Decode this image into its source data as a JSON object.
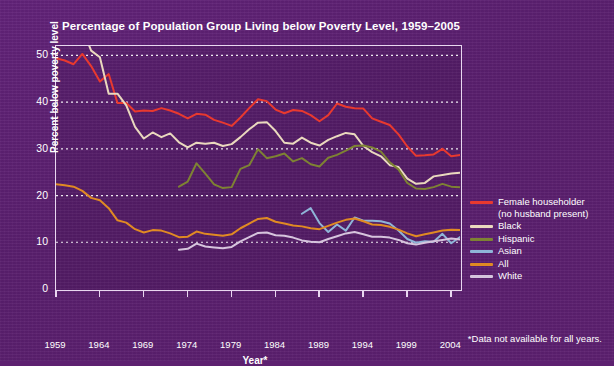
{
  "chart_data": {
    "type": "line",
    "title": "Percentage of Population Group Living below Poverty Level, 1959–2005",
    "xlabel": "Year*",
    "ylabel": "Percent below poverty level",
    "footnote": "*Data not available for all years.",
    "xlim": [
      1959,
      2005
    ],
    "ylim": [
      0,
      52
    ],
    "yticks": [
      0,
      10,
      20,
      30,
      40,
      50
    ],
    "xticks": [
      1959,
      1964,
      1969,
      1974,
      1979,
      1984,
      1989,
      1994,
      1999,
      2004
    ],
    "grid": "horizontal-dotted",
    "legend_position": "right",
    "background_color": "#5d2070",
    "plot_background_color": "#551c66",
    "axis_color": "#e9d7f0",
    "text_color": "#ffffff",
    "series": [
      {
        "name": "Female householder (no husband present)",
        "legend_label_line1": "Female householder",
        "legend_label_line2": "(no husband present)",
        "color": "#e8392f",
        "x": [
          1959,
          1960,
          1961,
          1962,
          1963,
          1964,
          1965,
          1966,
          1967,
          1968,
          1969,
          1970,
          1971,
          1972,
          1973,
          1974,
          1975,
          1976,
          1977,
          1978,
          1979,
          1980,
          1981,
          1982,
          1983,
          1984,
          1985,
          1986,
          1987,
          1988,
          1989,
          1990,
          1991,
          1992,
          1993,
          1994,
          1995,
          1996,
          1997,
          1998,
          1999,
          2000,
          2001,
          2002,
          2003,
          2004,
          2005
        ],
        "y": [
          49.4,
          48.9,
          48.1,
          50.3,
          47.7,
          44.4,
          46.0,
          39.8,
          39.8,
          38.0,
          38.2,
          38.1,
          38.7,
          38.2,
          37.5,
          36.5,
          37.5,
          37.3,
          36.2,
          35.6,
          34.9,
          36.7,
          38.7,
          40.6,
          40.2,
          38.4,
          37.6,
          38.3,
          38.1,
          37.2,
          35.9,
          37.2,
          39.7,
          39.0,
          38.7,
          38.6,
          36.5,
          35.8,
          35.1,
          33.1,
          30.5,
          28.5,
          28.6,
          28.8,
          30.0,
          28.4,
          28.7
        ]
      },
      {
        "name": "Black",
        "legend_label_line1": "Black",
        "legend_label_line2": "",
        "color": "#ead9be",
        "x": [
          1959,
          1960,
          1961,
          1962,
          1963,
          1964,
          1965,
          1966,
          1967,
          1968,
          1969,
          1970,
          1971,
          1972,
          1973,
          1974,
          1975,
          1976,
          1977,
          1978,
          1979,
          1980,
          1981,
          1982,
          1983,
          1984,
          1985,
          1986,
          1987,
          1988,
          1989,
          1990,
          1991,
          1992,
          1993,
          1994,
          1995,
          1996,
          1997,
          1998,
          1999,
          2000,
          2001,
          2002,
          2003,
          2004,
          2005
        ],
        "y": [
          55.1,
          55.9,
          54.0,
          55.8,
          51.0,
          49.6,
          41.8,
          41.8,
          39.3,
          34.7,
          32.2,
          33.5,
          32.5,
          33.3,
          31.4,
          30.3,
          31.3,
          31.1,
          31.3,
          30.6,
          31.0,
          32.5,
          34.2,
          35.6,
          35.7,
          33.8,
          31.3,
          31.1,
          32.4,
          31.3,
          30.7,
          31.9,
          32.7,
          33.4,
          33.1,
          30.6,
          29.3,
          28.4,
          26.5,
          26.1,
          23.6,
          22.5,
          22.7,
          24.1,
          24.4,
          24.7,
          24.9
        ]
      },
      {
        "name": "Hispanic",
        "legend_label_line1": "Hispanic",
        "legend_label_line2": "",
        "color": "#7e8233",
        "x": [
          1973,
          1974,
          1975,
          1976,
          1977,
          1978,
          1979,
          1980,
          1981,
          1982,
          1983,
          1984,
          1985,
          1986,
          1987,
          1988,
          1989,
          1990,
          1991,
          1992,
          1993,
          1994,
          1995,
          1996,
          1997,
          1998,
          1999,
          2000,
          2001,
          2002,
          2003,
          2004,
          2005
        ],
        "y": [
          21.9,
          23.0,
          26.9,
          24.7,
          22.4,
          21.6,
          21.8,
          25.7,
          26.5,
          29.9,
          28.0,
          28.4,
          29.0,
          27.3,
          28.0,
          26.7,
          26.2,
          28.1,
          28.7,
          29.6,
          30.6,
          30.7,
          30.3,
          29.4,
          27.1,
          25.6,
          22.7,
          21.5,
          21.4,
          21.8,
          22.5,
          21.9,
          21.8
        ]
      },
      {
        "name": "Asian",
        "legend_label_line1": "Asian",
        "legend_label_line2": "",
        "color": "#8fb5d8",
        "x": [
          1987,
          1988,
          1989,
          1990,
          1991,
          1992,
          1993,
          1994,
          1995,
          1996,
          1997,
          1998,
          1999,
          2000,
          2001,
          2002,
          2003,
          2004,
          2005
        ],
        "y": [
          16.1,
          17.3,
          14.1,
          12.2,
          13.8,
          12.5,
          15.3,
          14.6,
          14.6,
          14.5,
          14.0,
          12.5,
          10.7,
          9.9,
          10.2,
          10.1,
          11.8,
          9.8,
          11.1
        ]
      },
      {
        "name": "All",
        "legend_label_line1": "All",
        "legend_label_line2": "",
        "color": "#e08a23",
        "x": [
          1959,
          1960,
          1961,
          1962,
          1963,
          1964,
          1965,
          1966,
          1967,
          1968,
          1969,
          1970,
          1971,
          1972,
          1973,
          1974,
          1975,
          1976,
          1977,
          1978,
          1979,
          1980,
          1981,
          1982,
          1983,
          1984,
          1985,
          1986,
          1987,
          1988,
          1989,
          1990,
          1991,
          1992,
          1993,
          1994,
          1995,
          1996,
          1997,
          1998,
          1999,
          2000,
          2001,
          2002,
          2003,
          2004,
          2005
        ],
        "y": [
          22.4,
          22.2,
          21.9,
          21.0,
          19.5,
          19.0,
          17.3,
          14.7,
          14.2,
          12.8,
          12.1,
          12.6,
          12.5,
          11.9,
          11.1,
          11.2,
          12.3,
          11.8,
          11.6,
          11.4,
          11.7,
          13.0,
          14.0,
          15.0,
          15.2,
          14.4,
          14.0,
          13.6,
          13.4,
          13.0,
          12.8,
          13.5,
          14.2,
          14.8,
          15.1,
          14.5,
          13.8,
          13.7,
          13.3,
          12.7,
          11.9,
          11.3,
          11.7,
          12.1,
          12.5,
          12.7,
          12.6
        ]
      },
      {
        "name": "White",
        "legend_label_line1": "White",
        "legend_label_line2": "",
        "color": "#d6c4dd",
        "x": [
          1973,
          1974,
          1975,
          1976,
          1977,
          1978,
          1979,
          1980,
          1981,
          1982,
          1983,
          1984,
          1985,
          1986,
          1987,
          1988,
          1989,
          1990,
          1991,
          1992,
          1993,
          1994,
          1995,
          1996,
          1997,
          1998,
          1999,
          2000,
          2001,
          2002,
          2003,
          2004,
          2005
        ],
        "y": [
          8.4,
          8.6,
          9.7,
          9.1,
          8.9,
          8.7,
          9.0,
          10.2,
          11.1,
          12.0,
          12.1,
          11.5,
          11.4,
          11.0,
          10.4,
          10.1,
          10.0,
          10.7,
          11.3,
          11.9,
          12.2,
          11.7,
          11.2,
          11.2,
          11.0,
          10.5,
          9.8,
          9.5,
          9.9,
          10.2,
          10.5,
          10.8,
          10.6
        ]
      }
    ]
  },
  "legend": {
    "items": [
      {
        "label_line1": "Female householder",
        "label_line2": "(no husband present)",
        "color": "#e8392f"
      },
      {
        "label_line1": "Black",
        "label_line2": "",
        "color": "#ead9be"
      },
      {
        "label_line1": "Hispanic",
        "label_line2": "",
        "color": "#7e8233"
      },
      {
        "label_line1": "Asian",
        "label_line2": "",
        "color": "#8fb5d8"
      },
      {
        "label_line1": "All",
        "label_line2": "",
        "color": "#e08a23"
      },
      {
        "label_line1": "White",
        "label_line2": "",
        "color": "#d6c4dd"
      }
    ]
  }
}
